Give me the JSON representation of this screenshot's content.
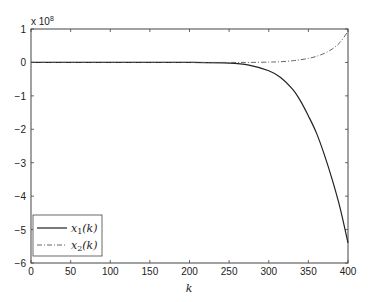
{
  "chart_data": {
    "type": "line",
    "title": "",
    "xlabel": "k",
    "ylabel": "",
    "y_scale_label": "x 10",
    "y_scale_exponent": "8",
    "xlim": [
      0,
      400
    ],
    "ylim": [
      -6,
      1
    ],
    "xticks": [
      0,
      50,
      100,
      150,
      200,
      250,
      300,
      350,
      400
    ],
    "yticks": [
      1,
      0,
      -1,
      -2,
      -3,
      -4,
      -5,
      -6
    ],
    "ytick_labels": [
      "1",
      "0",
      "−1",
      "−2",
      "−3",
      "−4",
      "−5",
      "−6"
    ],
    "grid": false,
    "legend_position": "lower left",
    "x": [
      0,
      50,
      100,
      150,
      200,
      250,
      275,
      300,
      315,
      330,
      340,
      350,
      360,
      370,
      380,
      390,
      400
    ],
    "series": [
      {
        "name": "x1(k)",
        "style": "solid",
        "color": "#222222",
        "values": [
          0,
          0,
          0,
          0,
          0,
          -0.02,
          -0.08,
          -0.25,
          -0.45,
          -0.8,
          -1.15,
          -1.6,
          -2.1,
          -2.75,
          -3.5,
          -4.35,
          -5.4
        ]
      },
      {
        "name": "x2(k)",
        "style": "dash-dot",
        "color": "#555555",
        "values": [
          0,
          0,
          0,
          0,
          0,
          0,
          0,
          0.01,
          0.02,
          0.05,
          0.08,
          0.12,
          0.18,
          0.27,
          0.4,
          0.6,
          0.93
        ]
      }
    ]
  },
  "legend": {
    "items": [
      {
        "base": "x",
        "sub": "1",
        "arg": "(k)"
      },
      {
        "base": "x",
        "sub": "2",
        "arg": "(k)"
      }
    ]
  }
}
